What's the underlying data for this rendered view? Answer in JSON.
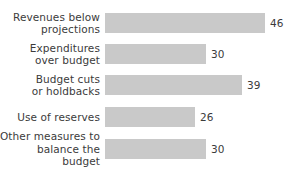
{
  "chart_data": {
    "type": "bar",
    "orientation": "horizontal",
    "title": "",
    "xlabel": "",
    "ylabel": "",
    "grid": false,
    "legend": false,
    "xlim": [
      0,
      46
    ],
    "categories": [
      "Revenues below\nprojections",
      "Expenditures\nover budget",
      "Budget cuts\nor holdbacks",
      "Use of reserves",
      "Other measures to\nbalance the budget"
    ],
    "values": [
      46,
      30,
      39,
      26,
      30
    ],
    "value_labels": [
      "46",
      "30",
      "39",
      "26",
      "30"
    ],
    "bar_color": "#c9c9c9",
    "text_color": "#3b3b3b",
    "background_color": "#ffffff"
  },
  "bars": [
    {
      "label": "Revenues below\nprojections",
      "value": 46,
      "value_label": "46",
      "width_px": 160
    },
    {
      "label": "Expenditures\nover budget",
      "value": 30,
      "value_label": "30",
      "width_px": 101
    },
    {
      "label": "Budget cuts\nor holdbacks",
      "value": 39,
      "value_label": "39",
      "width_px": 137
    },
    {
      "label": "Use of reserves",
      "value": 26,
      "value_label": "26",
      "width_px": 90
    },
    {
      "label": "Other measures to\nbalance the budget",
      "value": 30,
      "value_label": "30",
      "width_px": 101
    }
  ]
}
